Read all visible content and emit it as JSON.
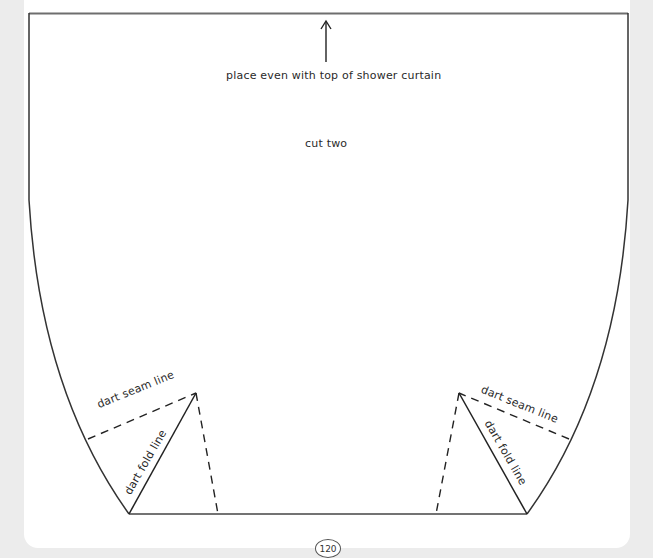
{
  "pattern": {
    "placement_note": "place even with top of shower curtain",
    "instruction": "cut two",
    "left_dart": {
      "seam_label": "dart seam line",
      "fold_label": "dart fold line"
    },
    "right_dart": {
      "seam_label": "dart seam line",
      "fold_label": "dart fold line"
    }
  },
  "footer": {
    "page_number": "120"
  },
  "colors": {
    "line": "#333333",
    "border": "#777777",
    "background": "#ececec",
    "page": "#ffffff"
  }
}
